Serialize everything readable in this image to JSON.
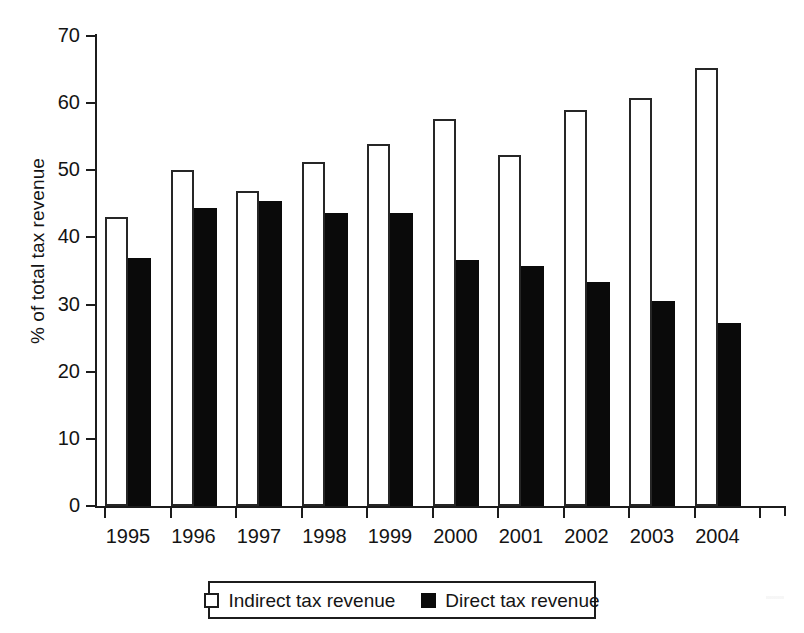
{
  "chart_data": {
    "type": "bar",
    "title": "",
    "subtitle": "",
    "xlabel": "",
    "ylabel": "% of total tax revenue",
    "categories": [
      "1995",
      "1996",
      "1997",
      "1998",
      "1999",
      "2000",
      "2001",
      "2002",
      "2003",
      "2004"
    ],
    "series": [
      {
        "name": "Indirect tax revenue",
        "color": "#ffffff",
        "edge_color": "#262626",
        "values": [
          43.0,
          50.0,
          46.9,
          51.3,
          53.9,
          57.6,
          52.3,
          59.0,
          60.8,
          65.2
        ]
      },
      {
        "name": "Direct tax revenue",
        "color": "#0a0a0a",
        "edge_color": "#0a0a0a",
        "values": [
          36.9,
          44.4,
          45.4,
          43.7,
          43.6,
          36.6,
          35.8,
          33.3,
          30.5,
          27.3
        ]
      }
    ],
    "ylim": [
      0,
      70
    ],
    "ytick_labels": [
      "0",
      "10",
      "20",
      "30",
      "40",
      "50",
      "60",
      "70"
    ],
    "ytick_values": [
      0,
      10,
      20,
      30,
      40,
      50,
      60,
      70
    ],
    "grid": false,
    "legend_position": "below-axis-center"
  },
  "legend": {
    "entries": [
      {
        "label": "Indirect tax revenue",
        "swatch": "open-square"
      },
      {
        "label": "Direct tax revenue",
        "swatch": "filled-square"
      }
    ]
  }
}
